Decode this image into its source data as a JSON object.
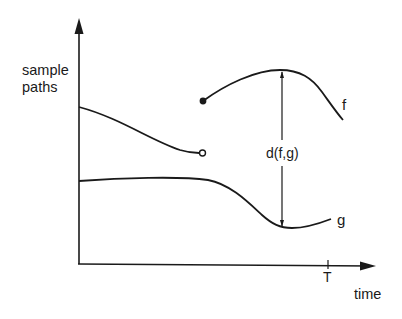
{
  "diagram": {
    "type": "sample-path-distance",
    "colors": {
      "ink": "#1a1a1a",
      "background": "#ffffff"
    },
    "axes": {
      "y_label_line1": "sample",
      "y_label_line2": "paths",
      "x_label": "time",
      "x_tick_label": "T"
    },
    "curves": [
      {
        "name": "upper-left segment",
        "end_marker": "open-circle"
      },
      {
        "name": "f",
        "label": "f",
        "start_marker": "filled-dot"
      },
      {
        "name": "g",
        "label": "g"
      }
    ],
    "distance_annotation": {
      "label": "d(f,g)",
      "between": [
        "f",
        "g"
      ]
    }
  }
}
